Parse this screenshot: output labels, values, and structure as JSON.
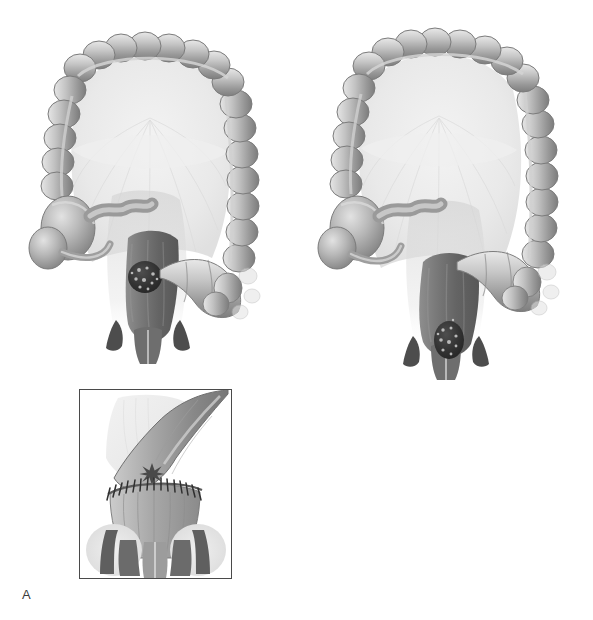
{
  "figure": {
    "background_color": "#ffffff",
    "style": "grayscale airbrushed medical illustration"
  },
  "palette": {
    "bowel_light": "#e4e4e4",
    "bowel_mid": "#b6b6b6",
    "bowel_dark": "#8a8a8a",
    "bowel_shadow": "#6d6d6d",
    "rectum_dark": "#7a7a7a",
    "rectum_darker": "#5d5d5d",
    "tumor": "#3a3a3a",
    "tumor_speckle": "#d8d8d8",
    "sphincter": "#4f4f4f",
    "mesentery": "#ededed",
    "outline": "#6f6f6f",
    "frame_border": "#4a4a4a",
    "label_text": "#3b3b3b",
    "star_marker": "#4a4a4a",
    "suture": "#2f2f2f"
  },
  "panels": [
    {
      "id": "A",
      "label": "A",
      "label_position": {
        "x": 22,
        "y": 588
      },
      "caption": "Low anterior resection with colorectal anastomosis",
      "anatomy": {
        "view": "anterior view of colon and rectum",
        "tumor": {
          "name": "rectal-tumor",
          "location": "upper rectum / rectosigmoid junction",
          "appearance": "dark irregular speckled mass",
          "center": {
            "x": 145,
            "y": 277
          },
          "radius": 17
        },
        "structures": [
          "transverse-colon",
          "ascending-colon",
          "descending-colon",
          "sigmoid-colon",
          "cecum",
          "appendix",
          "terminal-ileum",
          "rectum",
          "anal-canal",
          "anal-sphincter",
          "mesentery"
        ]
      },
      "inset": {
        "name": "anastomosis-detail",
        "frame": {
          "x": 79,
          "y": 389,
          "width": 153,
          "height": 190
        },
        "content": "Sutured end-to-end colorectal anastomosis at the anal canal with levator muscles and sphincter complex",
        "marker": {
          "type": "star",
          "label": "anastomosis-site-star",
          "x": 124,
          "y": 474
        },
        "suture_count": 17,
        "features": [
          "colon-segment",
          "suture-line",
          "anal-canal",
          "internal-sphincter",
          "external-sphincter",
          "ischiorectal-fat"
        ]
      }
    },
    {
      "id": "B",
      "label": "B",
      "label_position": {
        "x": 356,
        "y": 516
      },
      "caption": "Low rectal tumor with coloanal reconstruction",
      "anatomy": {
        "view": "anterior view of colon and rectum",
        "tumor": {
          "name": "rectal-tumor",
          "location": "low rectum just above anal canal",
          "appearance": "dark irregular speckled mass",
          "center": {
            "x": 456,
            "y": 340
          },
          "radius": 15
        },
        "structures": [
          "transverse-colon",
          "ascending-colon",
          "descending-colon",
          "sigmoid-colon",
          "cecum",
          "appendix",
          "terminal-ileum",
          "rectum",
          "anal-canal",
          "anal-sphincter",
          "mesentery"
        ]
      },
      "inset": {
        "name": "coloanal-detail",
        "frame": {
          "x": 396,
          "y": 436,
          "width": 146,
          "height": 98
        },
        "content": "Longitudinal section through the anal canal and distal bowel showing mucosal folds and sphincter layers",
        "marker": {
          "type": "star",
          "label": "anastomosis-site-star",
          "x": 508,
          "y": 477
        },
        "features": [
          "bowel-lumen",
          "mucosal-folds",
          "internal-sphincter",
          "external-sphincter",
          "anal-canal-wall"
        ]
      }
    }
  ]
}
